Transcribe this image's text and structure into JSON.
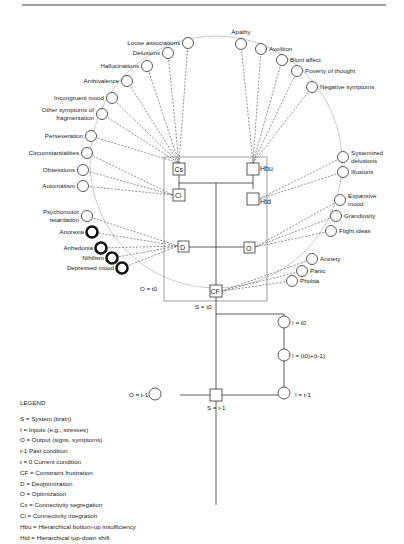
{
  "diagram": {
    "top_rule": true,
    "system_box_label": "S = t0",
    "output_arc_label": "O = t0",
    "nodes": {
      "Cs": "Cs",
      "Ci": "Ci",
      "Hbu": "Hbu",
      "Htd": "Htd",
      "D": "D",
      "O": "O",
      "CF": "CF"
    },
    "symptoms": [
      {
        "label": "Loose associations",
        "x": 188,
        "y": 43,
        "target": "Cs",
        "bold": false,
        "anchor": "end"
      },
      {
        "label": "Delusions",
        "x": 168,
        "y": 53,
        "target": "Cs",
        "bold": false,
        "anchor": "end"
      },
      {
        "label": "Hallucinations",
        "x": 147,
        "y": 66,
        "target": "Cs",
        "bold": false,
        "anchor": "end"
      },
      {
        "label": "Ambivalence",
        "x": 127,
        "y": 81,
        "target": "Cs",
        "bold": false,
        "anchor": "end"
      },
      {
        "label": "Incongruent mood",
        "x": 112,
        "y": 98,
        "target": "Cs",
        "bold": false,
        "anchor": "end"
      },
      {
        "label": "Other symptoms of|fragmentation",
        "x": 102,
        "y": 114,
        "target": "Cs",
        "bold": false,
        "anchor": "end"
      },
      {
        "label": "Perseveration",
        "x": 91,
        "y": 136,
        "target": "Cs",
        "bold": false,
        "anchor": "end"
      },
      {
        "label": "Circumstantialities",
        "x": 87,
        "y": 153,
        "target": "Ci",
        "bold": false,
        "anchor": "end"
      },
      {
        "label": "Obsessions",
        "x": 83,
        "y": 170,
        "target": "Ci",
        "bold": false,
        "anchor": "end"
      },
      {
        "label": "Automatism",
        "x": 83,
        "y": 186,
        "target": "Ci",
        "bold": false,
        "anchor": "end"
      },
      {
        "label": "Psychomotor|retardation",
        "x": 87,
        "y": 216,
        "target": "D",
        "bold": false,
        "anchor": "end"
      },
      {
        "label": "Anorexia",
        "x": 92,
        "y": 232,
        "target": "D",
        "bold": true,
        "anchor": "end"
      },
      {
        "label": "Anhedonia",
        "x": 101,
        "y": 248,
        "target": "D",
        "bold": true,
        "anchor": "end"
      },
      {
        "label": "Nihilism",
        "x": 112,
        "y": 258,
        "target": "D",
        "bold": true,
        "anchor": "end"
      },
      {
        "label": "Depressed mood",
        "x": 122,
        "y": 268,
        "target": "D",
        "bold": true,
        "anchor": "end"
      },
      {
        "label": "Apathy",
        "x": 241,
        "y": 44,
        "target": "Hbu",
        "bold": false,
        "anchor": "above"
      },
      {
        "label": "Avolition",
        "x": 261,
        "y": 49,
        "target": "Hbu",
        "bold": false,
        "anchor": "start"
      },
      {
        "label": "Blunt affect",
        "x": 282,
        "y": 60,
        "target": "Hbu",
        "bold": false,
        "anchor": "start"
      },
      {
        "label": "Poverty of thought",
        "x": 297,
        "y": 71,
        "target": "Hbu",
        "bold": false,
        "anchor": "start"
      },
      {
        "label": "Negative symptoms",
        "x": 312,
        "y": 87,
        "target": "Hbu",
        "bold": false,
        "anchor": "start"
      },
      {
        "label": "Systemized|delusions",
        "x": 343,
        "y": 157,
        "target": "Htd",
        "bold": false,
        "anchor": "start"
      },
      {
        "label": "Illusions",
        "x": 343,
        "y": 172,
        "target": "Htd",
        "bold": false,
        "anchor": "start"
      },
      {
        "label": "Expansive|mood",
        "x": 340,
        "y": 200,
        "target": "O",
        "bold": false,
        "anchor": "start"
      },
      {
        "label": "Grandiosity",
        "x": 336,
        "y": 216,
        "target": "O",
        "bold": false,
        "anchor": "start"
      },
      {
        "label": "Flight ideas",
        "x": 331,
        "y": 231,
        "target": "O",
        "bold": false,
        "anchor": "start"
      },
      {
        "label": "Anxiety",
        "x": 312,
        "y": 259,
        "target": "CF",
        "bold": false,
        "anchor": "start"
      },
      {
        "label": "Panic",
        "x": 302,
        "y": 271,
        "target": "CF",
        "bold": false,
        "anchor": "start"
      },
      {
        "label": "Phobia",
        "x": 292,
        "y": 281,
        "target": "CF",
        "bold": false,
        "anchor": "start"
      }
    ],
    "time_nodes": {
      "I_t0": "I = t0",
      "I_mid": "I = (t0)+(t-1)",
      "I_t1": "I = t-1",
      "O_t1": "O = t-1",
      "S_t1": "S = t-1"
    }
  },
  "legend": {
    "title": "LEGEND",
    "items": [
      "S = System (brain)",
      "I = Inputs (e.g., stresses)",
      "O = Output (signs, symptoms)",
      "t-1 Past condition",
      "t = 0 Current condition",
      "CF = Constraint frustration",
      "D = Deoptimization",
      "O = Optimization",
      "Cs = Connectivity segregation",
      "Ci = Connectivity integration",
      "Hbu = Hierarchical bottom-up insufficiency",
      "Htd = Hierarchical top-down shift"
    ]
  }
}
